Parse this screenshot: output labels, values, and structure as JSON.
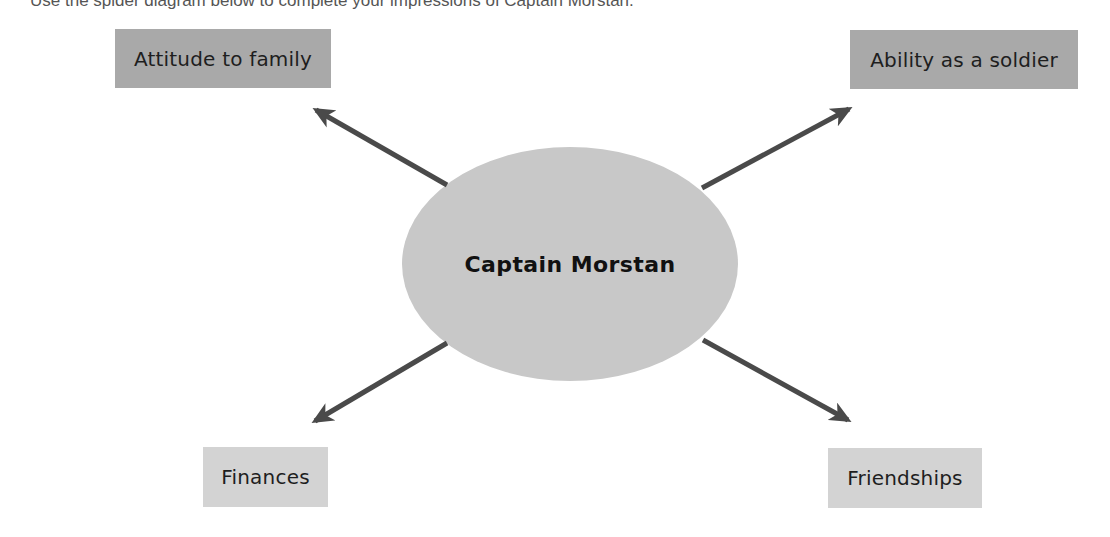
{
  "instruction": "Use the spider diagram below to complete your impressions of Captain Morstan.",
  "center": {
    "label": "Captain Morstan",
    "fill": "#c8c8c8"
  },
  "nodes": [
    {
      "id": "attitude-to-family",
      "label": "Attitude to family",
      "fill": "#a9a9a9"
    },
    {
      "id": "ability-as-a-soldier",
      "label": "Ability as a soldier",
      "fill": "#a9a9a9"
    },
    {
      "id": "finances",
      "label": "Finances",
      "fill": "#d3d3d3"
    },
    {
      "id": "friendships",
      "label": "Friendships",
      "fill": "#d3d3d3"
    }
  ],
  "arrow_color": "#4a4a4a"
}
